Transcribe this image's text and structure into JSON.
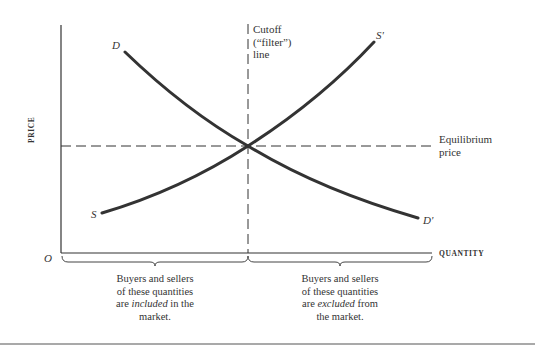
{
  "diagram": {
    "axes": {
      "y_label": "PRICE",
      "x_label": "QUANTITY",
      "origin_label": "O"
    },
    "curves": {
      "demand_start": "D",
      "demand_end": "D'",
      "supply_start": "S",
      "supply_end": "S'"
    },
    "cutoff_line": {
      "label_line1": "Cutoff",
      "label_line2": "(“filter”)",
      "label_line3": "line"
    },
    "equilibrium": {
      "label_line1": "Equilibrium",
      "label_line2": "price"
    },
    "captions": {
      "left": {
        "line1": "Buyers and sellers",
        "line2": "of these quantities",
        "line3_pre": "are ",
        "line3_em": "included",
        "line3_post": " in the",
        "line4": "market."
      },
      "right": {
        "line1": "Buyers and sellers",
        "line2": "of these quantities",
        "line3_pre": "are ",
        "line3_em": "excluded",
        "line3_post": " from",
        "line4": "the market."
      }
    }
  }
}
